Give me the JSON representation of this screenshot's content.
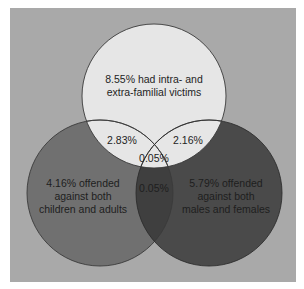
{
  "diagram": {
    "type": "venn",
    "colors": {
      "background": "#a9a9a9",
      "top_circle": "#e6e6e6",
      "left_circle": "#707070",
      "right_circle": "#4a4a4a",
      "left_right_overlap": "#3f3f3f",
      "outline": "#3a3a3a",
      "text": "#1e1e1e"
    },
    "sets": [
      {
        "id": "top",
        "label_lines": [
          "8.55% had intra- and",
          "extra-familial victims"
        ],
        "value": "8.55%"
      },
      {
        "id": "left",
        "label_lines": [
          "4.16% offended",
          "against both",
          "children and adults"
        ],
        "value": "4.16%"
      },
      {
        "id": "right",
        "label_lines": [
          "5.79% offended",
          "against both",
          "males and females"
        ],
        "value": "5.79%"
      }
    ],
    "intersections": {
      "top_left": "2.83%",
      "top_right": "2.16%",
      "all_three": "0.05%",
      "left_right": "0.05%"
    }
  }
}
